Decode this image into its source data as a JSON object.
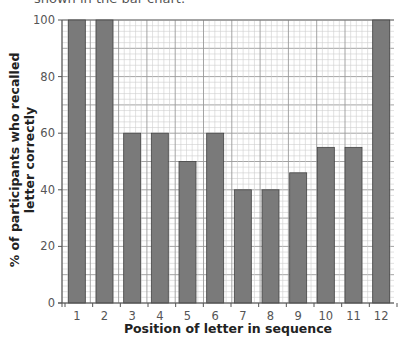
{
  "caption_fragment": "shown in the bar chart.",
  "chart_data": {
    "type": "bar",
    "title": "",
    "xlabel": "Position of letter in sequence",
    "ylabel": "% of participants who recalled letter correctly",
    "ylabel_lines": [
      "% of participants who recalled",
      "letter correctly"
    ],
    "categories": [
      "1",
      "2",
      "3",
      "4",
      "5",
      "6",
      "7",
      "8",
      "9",
      "10",
      "11",
      "12"
    ],
    "values": [
      100,
      100,
      60,
      60,
      50,
      60,
      40,
      40,
      46,
      55,
      55,
      100
    ],
    "ylim": [
      0,
      100
    ],
    "yticks": [
      0,
      20,
      40,
      60,
      80,
      100
    ],
    "grid": true,
    "grid_style": "graph-paper (minor every 2, major every 10)",
    "legend": null,
    "bar_color": "#7a7a7a",
    "bar_edge_color": "#444444"
  }
}
